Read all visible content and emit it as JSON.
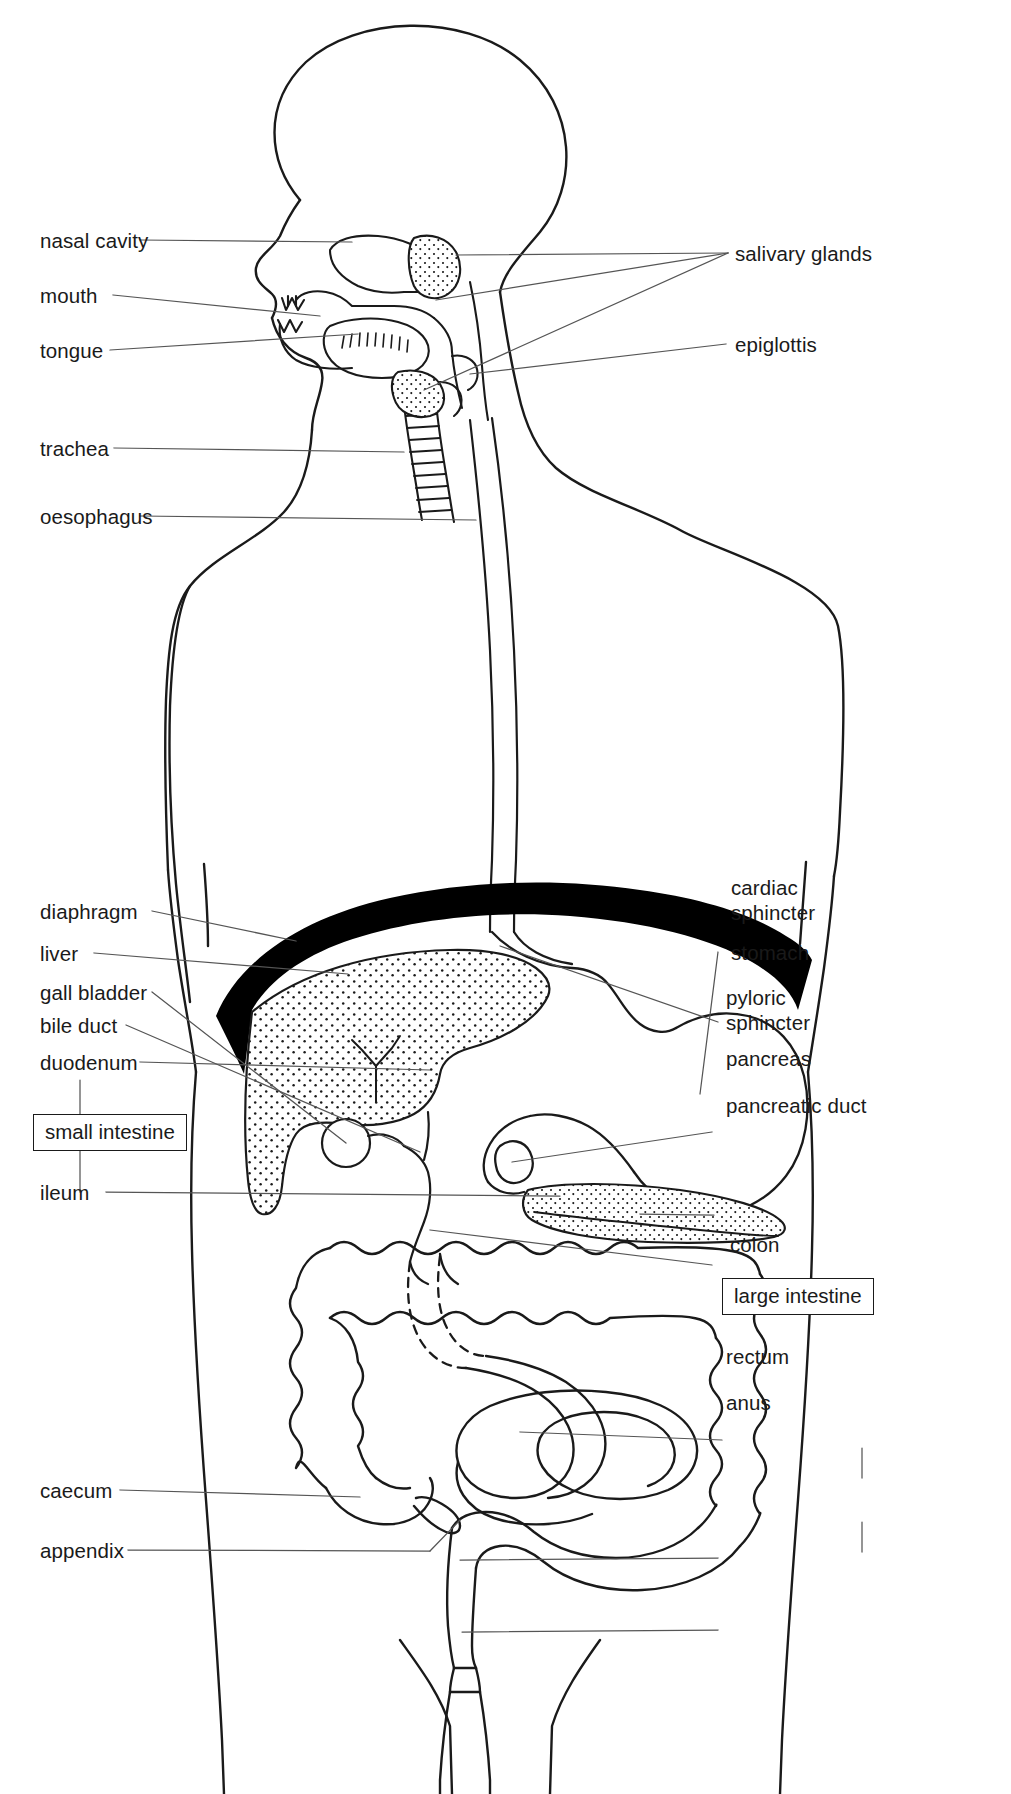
{
  "diagram": {
    "type": "labelled anatomical line diagram",
    "style": {
      "ink": "#1a1a1a",
      "leader": "#555555",
      "background": "#ffffff",
      "fill_stipple": "#1a1a1a",
      "diaphragm_fill": "#000000"
    }
  },
  "labels_left": [
    {
      "id": "nasal-cavity",
      "text": "nasal cavity"
    },
    {
      "id": "mouth",
      "text": "mouth"
    },
    {
      "id": "tongue",
      "text": "tongue"
    },
    {
      "id": "trachea",
      "text": "trachea"
    },
    {
      "id": "oesophagus",
      "text": "oesophagus"
    },
    {
      "id": "diaphragm",
      "text": "diaphragm"
    },
    {
      "id": "liver",
      "text": "liver"
    },
    {
      "id": "gall-bladder",
      "text": "gall bladder"
    },
    {
      "id": "bile-duct",
      "text": "bile duct"
    },
    {
      "id": "duodenum",
      "text": "duodenum"
    },
    {
      "id": "ileum",
      "text": "ileum"
    },
    {
      "id": "caecum",
      "text": "caecum"
    },
    {
      "id": "appendix",
      "text": "appendix"
    }
  ],
  "labels_right": [
    {
      "id": "salivary-glands",
      "text": "salivary glands"
    },
    {
      "id": "epiglottis",
      "text": "epiglottis"
    },
    {
      "id": "cardiac-sphincter",
      "text": "cardiac\nsphincter"
    },
    {
      "id": "stomach",
      "text": "stomach"
    },
    {
      "id": "pyloric-sphincter",
      "text": "pyloric\nsphincter"
    },
    {
      "id": "pancreas",
      "text": "pancreas"
    },
    {
      "id": "pancreatic-duct",
      "text": "pancreatic duct"
    },
    {
      "id": "colon",
      "text": "colon"
    },
    {
      "id": "rectum",
      "text": "rectum"
    },
    {
      "id": "anus",
      "text": "anus"
    }
  ],
  "boxed_labels": [
    {
      "id": "small-intestine",
      "text": "small intestine",
      "groups": [
        "duodenum",
        "ileum"
      ]
    },
    {
      "id": "large-intestine",
      "text": "large intestine",
      "groups": [
        "colon",
        "rectum"
      ]
    }
  ]
}
